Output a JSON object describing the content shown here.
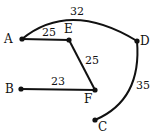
{
  "graph": {
    "nodes": [
      {
        "id": "A",
        "label": "A",
        "x": 22,
        "y": 39,
        "lx": 4,
        "ly": 43
      },
      {
        "id": "E",
        "label": "E",
        "x": 69,
        "y": 40,
        "lx": 64,
        "ly": 33
      },
      {
        "id": "D",
        "label": "D",
        "x": 137,
        "y": 41,
        "lx": 140,
        "ly": 45
      },
      {
        "id": "B",
        "label": "B",
        "x": 21,
        "y": 89,
        "lx": 5,
        "ly": 93
      },
      {
        "id": "F",
        "label": "F",
        "x": 95,
        "y": 90,
        "lx": 84,
        "ly": 103
      },
      {
        "id": "C",
        "label": "C",
        "x": 95,
        "y": 120,
        "lx": 98,
        "ly": 131
      }
    ],
    "edges": [
      {
        "from": "A",
        "to": "D",
        "weight": "32",
        "curved": true,
        "wx": 70,
        "wy": 15
      },
      {
        "from": "A",
        "to": "E",
        "weight": "25",
        "curved": false,
        "wx": 42,
        "wy": 36
      },
      {
        "from": "E",
        "to": "F",
        "weight": "25",
        "curved": false,
        "wx": 85,
        "wy": 64
      },
      {
        "from": "B",
        "to": "F",
        "weight": "23",
        "curved": false,
        "wx": 51,
        "wy": 85
      },
      {
        "from": "D",
        "to": "C",
        "weight": "35",
        "curved": true,
        "wx": 136,
        "wy": 89
      }
    ]
  }
}
